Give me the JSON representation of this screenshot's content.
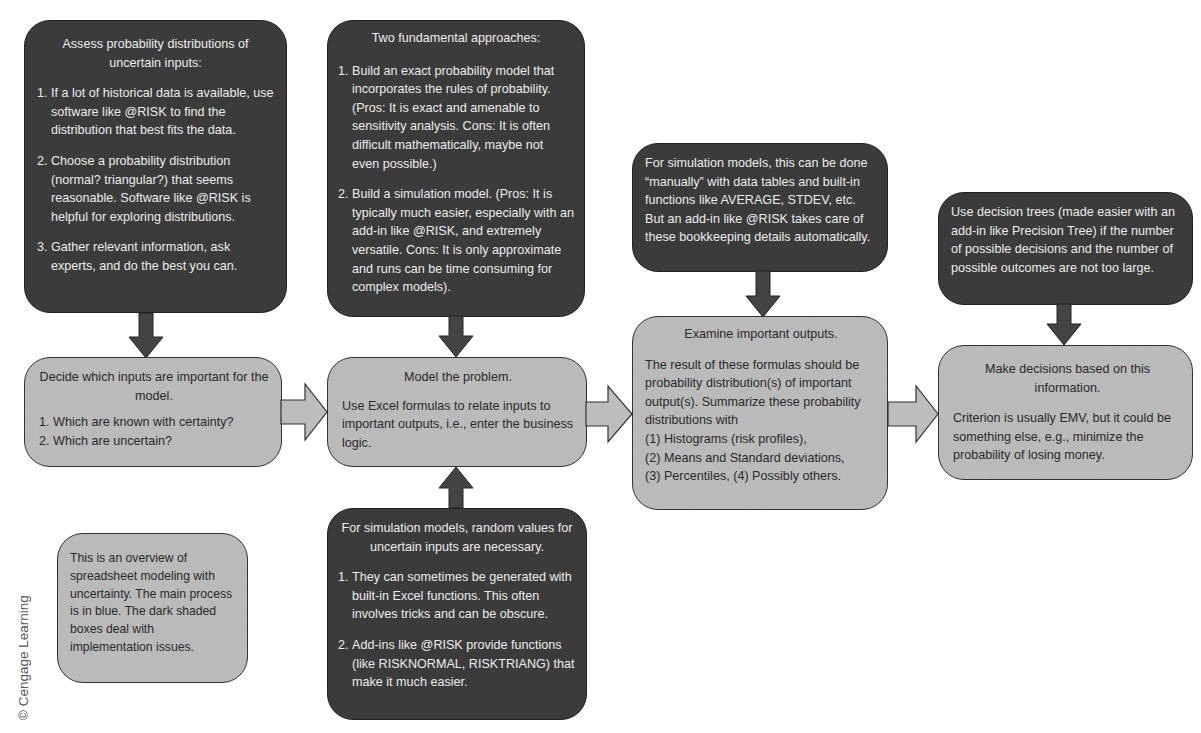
{
  "copyright": "© Cengage Learning",
  "boxes": {
    "assess": {
      "heading": "Assess probability distributions of uncertain inputs:",
      "items": [
        {
          "num": "1.",
          "text": "If a lot of historical data is available, use software like @RISK to find the distribution that best fits the data."
        },
        {
          "num": "2.",
          "text": "Choose a probability distribution (normal? triangular?) that seems reasonable. Software like @RISK is helpful for exploring distributions."
        },
        {
          "num": "3.",
          "text": "Gather relevant information, ask experts, and do the best you can."
        }
      ]
    },
    "decide_inputs": {
      "heading": "Decide which inputs are important for the model.",
      "items": [
        {
          "num": "1.",
          "text": "Which are known with certainty?"
        },
        {
          "num": "2.",
          "text": "Which are uncertain?"
        }
      ]
    },
    "approaches": {
      "heading": "Two fundamental approaches:",
      "items": [
        {
          "num": "1.",
          "text": "Build an exact probability model that incorporates the rules of probability. (Pros: It is exact and amenable to sensitivity analysis. Cons: It is often difficult mathematically, maybe not even possible.)"
        },
        {
          "num": "2.",
          "text": "Build a simulation model. (Pros: It is typically much easier, especially with an add-in like @RISK, and extremely versatile. Cons: It is only approximate and runs can be time consuming for complex models)."
        }
      ]
    },
    "model": {
      "heading": "Model the problem.",
      "body": "Use Excel formulas to relate inputs to important outputs, i.e., enter the business logic."
    },
    "random_values": {
      "heading": "For simulation models, random values for uncertain inputs are necessary.",
      "items": [
        {
          "num": "1.",
          "text": "They can sometimes be generated with built-in Excel functions. This often involves tricks and can be obscure."
        },
        {
          "num": "2.",
          "text": "Add-ins like @RISK provide functions (like RISKNORMAL, RISKTRIANG) that make it much easier."
        }
      ]
    },
    "bookkeeping": {
      "body": "For simulation models, this can be done “manually” with data tables and built-in functions like AVERAGE, STDEV, etc. But an add-in like @RISK takes care of these bookkeeping details automatically."
    },
    "examine": {
      "heading": "Examine important outputs.",
      "body": "The result of these formulas should be probability distribution(s) of important output(s). Summarize these probability distributions with",
      "lines": [
        "(1) Histograms (risk profiles),",
        "(2) Means and Standard deviations,",
        "(3) Percentiles, (4) Possibly others."
      ]
    },
    "decision_trees": {
      "body": "Use decision trees (made easier with an add-in like Precision Tree) if the number of possible decisions and the number of possible outcomes are not too large."
    },
    "make_decisions": {
      "heading": "Make decisions based on this information.",
      "body": "Criterion is usually EMV, but it could be something else, e.g., minimize the probability of losing money."
    },
    "overview_note": {
      "body": "This is an overview of spreadsheet modeling with uncertainty. The main process is in blue. The dark shaded boxes deal with implementation issues."
    }
  },
  "colors": {
    "dark_box": "#3b3b3b",
    "light_box": "#b9b9b9",
    "arrow_dark": "#444444",
    "arrow_light": "#bdbdbd"
  }
}
